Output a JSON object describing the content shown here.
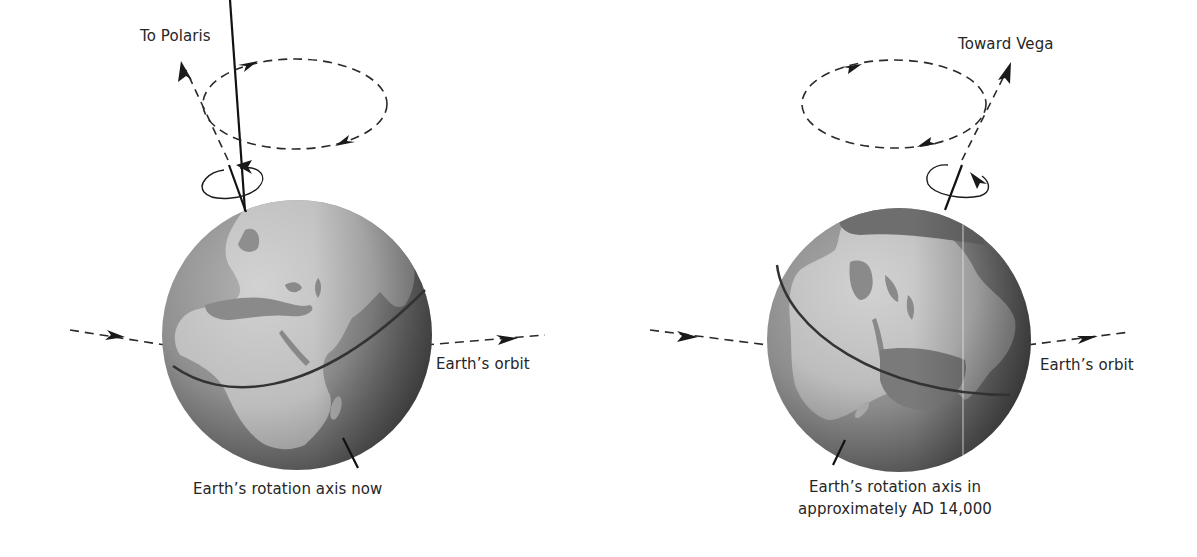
{
  "figure": {
    "colors": {
      "background": "#ffffff",
      "ink": "#222222",
      "ocean_light": "#9a9a9a",
      "ocean_dark": "#555555",
      "land": "#c4c4c4",
      "equator": "#3a3a3a"
    },
    "panels": [
      {
        "id": "now",
        "star_label": "To Polaris",
        "orbit_label": "Earth’s orbit",
        "axis_caption_line1": "Earth’s rotation axis now",
        "axis_caption_line2": ""
      },
      {
        "id": "ad14000",
        "star_label": "Toward Vega",
        "orbit_label": "Earth’s orbit",
        "axis_caption_line1": "Earth’s rotation axis in",
        "axis_caption_line2": "approximately AD 14,000"
      }
    ]
  }
}
